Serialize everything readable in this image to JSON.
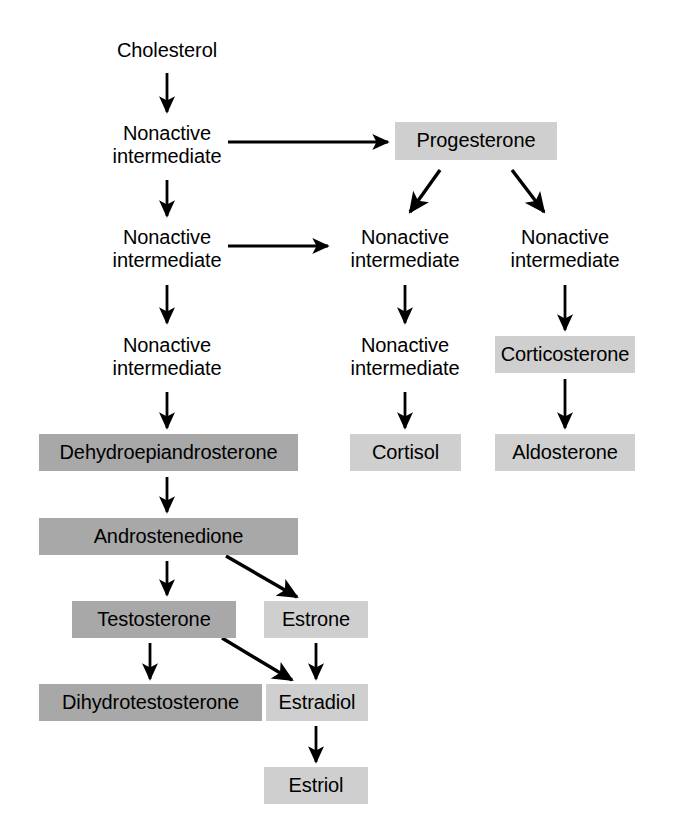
{
  "diagram": {
    "type": "flowchart",
    "background_color": "#ffffff",
    "colors": {
      "box_dark_gray": "#a8a8a8",
      "box_light_gray": "#cfcfcf",
      "text": "#000000",
      "arrow": "#000000"
    },
    "nodes": [
      {
        "id": "cholesterol",
        "label": "Cholesterol",
        "style": "plain",
        "x": 104,
        "y": 36,
        "w": 126,
        "h": 30
      },
      {
        "id": "nonactive-1",
        "label": "Nonactive\nintermediate",
        "style": "plain",
        "x": 96,
        "y": 118,
        "w": 142,
        "h": 54
      },
      {
        "id": "progesterone",
        "label": "Progesterone",
        "style": "box-light",
        "x": 395,
        "y": 122,
        "w": 162,
        "h": 38
      },
      {
        "id": "nonactive-2",
        "label": "Nonactive\nintermediate",
        "style": "plain",
        "x": 96,
        "y": 222,
        "w": 142,
        "h": 54
      },
      {
        "id": "nonactive-3",
        "label": "Nonactive\nintermediate",
        "style": "plain",
        "x": 334,
        "y": 222,
        "w": 142,
        "h": 54
      },
      {
        "id": "nonactive-4",
        "label": "Nonactive\nintermediate",
        "style": "plain",
        "x": 494,
        "y": 222,
        "w": 142,
        "h": 54
      },
      {
        "id": "nonactive-5",
        "label": "Nonactive\nintermediate",
        "style": "plain",
        "x": 96,
        "y": 330,
        "w": 142,
        "h": 54
      },
      {
        "id": "nonactive-6",
        "label": "Nonactive\nintermediate",
        "style": "plain",
        "x": 334,
        "y": 330,
        "w": 142,
        "h": 54
      },
      {
        "id": "corticosterone",
        "label": "Corticosterone",
        "style": "box-light",
        "x": 495,
        "y": 336,
        "w": 140,
        "h": 37
      },
      {
        "id": "dehydroepiandrosterone",
        "label": "Dehydroepiandrosterone",
        "style": "box-dark",
        "x": 39,
        "y": 434,
        "w": 259,
        "h": 37
      },
      {
        "id": "cortisol",
        "label": "Cortisol",
        "style": "box-light",
        "x": 350,
        "y": 434,
        "w": 111,
        "h": 37
      },
      {
        "id": "aldosterone",
        "label": "Aldosterone",
        "style": "box-light",
        "x": 495,
        "y": 434,
        "w": 140,
        "h": 37
      },
      {
        "id": "androstenedione",
        "label": "Androstenedione",
        "style": "box-dark",
        "x": 39,
        "y": 518,
        "w": 259,
        "h": 37
      },
      {
        "id": "testosterone",
        "label": "Testosterone",
        "style": "box-dark",
        "x": 72,
        "y": 601,
        "w": 164,
        "h": 37
      },
      {
        "id": "estrone",
        "label": "Estrone",
        "style": "box-light",
        "x": 264,
        "y": 601,
        "w": 104,
        "h": 37
      },
      {
        "id": "dihydrotestosterone",
        "label": "Dihydrotestosterone",
        "style": "box-dark",
        "x": 39,
        "y": 684,
        "w": 223,
        "h": 37
      },
      {
        "id": "estradiol",
        "label": "Estradiol",
        "style": "box-light",
        "x": 266,
        "y": 684,
        "w": 102,
        "h": 37
      },
      {
        "id": "estriol",
        "label": "Estriol",
        "style": "box-light",
        "x": 264,
        "y": 767,
        "w": 104,
        "h": 37
      }
    ],
    "edges": [
      {
        "id": "cholesterol-to-nonactive-1",
        "from": "cholesterol",
        "to": "nonactive-1",
        "kind": "vertical",
        "x1": 167,
        "y1": 73,
        "x2": 167,
        "y2": 112
      },
      {
        "id": "nonactive-1-to-progesterone",
        "from": "nonactive-1",
        "to": "progesterone",
        "kind": "horizontal",
        "x1": 228,
        "y1": 142,
        "x2": 388,
        "y2": 142
      },
      {
        "id": "nonactive-1-to-nonactive-2",
        "from": "nonactive-1",
        "to": "nonactive-2",
        "kind": "vertical",
        "x1": 167,
        "y1": 180,
        "x2": 167,
        "y2": 216
      },
      {
        "id": "progesterone-to-nonactive-3",
        "from": "progesterone",
        "to": "nonactive-3",
        "kind": "diagonal",
        "x1": 440,
        "y1": 170,
        "x2": 410,
        "y2": 212
      },
      {
        "id": "progesterone-to-nonactive-4",
        "from": "progesterone",
        "to": "nonactive-4",
        "kind": "diagonal",
        "x1": 512,
        "y1": 170,
        "x2": 544,
        "y2": 212
      },
      {
        "id": "nonactive-2-to-nonactive-3",
        "from": "nonactive-2",
        "to": "nonactive-3",
        "kind": "horizontal",
        "x1": 228,
        "y1": 246,
        "x2": 328,
        "y2": 246
      },
      {
        "id": "nonactive-2-to-nonactive-5",
        "from": "nonactive-2",
        "to": "nonactive-5",
        "kind": "vertical",
        "x1": 167,
        "y1": 285,
        "x2": 167,
        "y2": 323
      },
      {
        "id": "nonactive-3-to-nonactive-6",
        "from": "nonactive-3",
        "to": "nonactive-6",
        "kind": "vertical",
        "x1": 405,
        "y1": 285,
        "x2": 405,
        "y2": 323
      },
      {
        "id": "nonactive-4-to-corticosterone",
        "from": "nonactive-4",
        "to": "corticosterone",
        "kind": "vertical",
        "x1": 565,
        "y1": 285,
        "x2": 565,
        "y2": 330
      },
      {
        "id": "nonactive-5-to-dhea",
        "from": "nonactive-5",
        "to": "dehydroepiandrosterone",
        "kind": "vertical",
        "x1": 167,
        "y1": 392,
        "x2": 167,
        "y2": 428
      },
      {
        "id": "nonactive-6-to-cortisol",
        "from": "nonactive-6",
        "to": "cortisol",
        "kind": "vertical",
        "x1": 405,
        "y1": 392,
        "x2": 405,
        "y2": 428
      },
      {
        "id": "corticosterone-to-aldosterone",
        "from": "corticosterone",
        "to": "aldosterone",
        "kind": "vertical",
        "x1": 565,
        "y1": 379,
        "x2": 565,
        "y2": 428
      },
      {
        "id": "dhea-to-androstenedione",
        "from": "dehydroepiandrosterone",
        "to": "androstenedione",
        "kind": "vertical",
        "x1": 167,
        "y1": 477,
        "x2": 167,
        "y2": 512
      },
      {
        "id": "androstenedione-to-testosterone",
        "from": "androstenedione",
        "to": "testosterone",
        "kind": "vertical",
        "x1": 167,
        "y1": 561,
        "x2": 167,
        "y2": 595
      },
      {
        "id": "androstenedione-to-estrone",
        "from": "androstenedione",
        "to": "estrone",
        "kind": "diagonal",
        "x1": 226,
        "y1": 556,
        "x2": 297,
        "y2": 597
      },
      {
        "id": "testosterone-to-dihydrotestosterone",
        "from": "testosterone",
        "to": "dihydrotestosterone",
        "kind": "vertical",
        "x1": 150,
        "y1": 643,
        "x2": 150,
        "y2": 679
      },
      {
        "id": "testosterone-to-estradiol",
        "from": "testosterone",
        "to": "estradiol",
        "kind": "diagonal",
        "x1": 222,
        "y1": 638,
        "x2": 292,
        "y2": 680
      },
      {
        "id": "estrone-to-estradiol",
        "from": "estrone",
        "to": "estradiol",
        "kind": "vertical",
        "x1": 316,
        "y1": 643,
        "x2": 316,
        "y2": 679
      },
      {
        "id": "estradiol-to-estriol",
        "from": "estradiol",
        "to": "estriol",
        "kind": "vertical",
        "x1": 316,
        "y1": 726,
        "x2": 316,
        "y2": 762
      }
    ]
  }
}
